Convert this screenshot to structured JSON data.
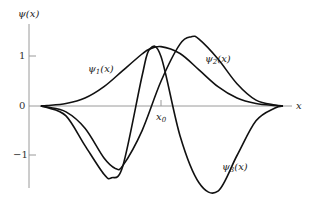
{
  "chart_data": {
    "type": "line",
    "title": "",
    "xlabel": "x",
    "ylabel": "ψ(x)",
    "x_marker": {
      "label": "x0",
      "sub": "0",
      "x": 0
    },
    "yticks": [
      1,
      0,
      -1
    ],
    "ytick_labels": [
      "1",
      "0",
      "−1"
    ],
    "ylim": [
      -1.8,
      1.8
    ],
    "xlim": [
      -3.6,
      3.6
    ],
    "grid": false,
    "legend": "inline curve labels",
    "series": [
      {
        "name": "ψ1(x)",
        "label_base": "ψ",
        "label_sub": "1",
        "x": [
          -3.0,
          -2.5,
          -2.0,
          -1.5,
          -1.0,
          -0.5,
          -0.3,
          0.0,
          0.5,
          1.0,
          1.5,
          2.0,
          2.5,
          3.0
        ],
        "values": [
          0.01,
          0.05,
          0.16,
          0.39,
          0.72,
          1.05,
          1.15,
          1.2,
          1.06,
          0.73,
          0.39,
          0.16,
          0.05,
          0.01
        ]
      },
      {
        "name": "ψ2(x)",
        "label_base": "ψ",
        "label_sub": "2",
        "x": [
          -3.0,
          -2.5,
          -2.0,
          -1.5,
          -1.2,
          -1.0,
          -0.5,
          0.0,
          0.5,
          0.8,
          1.0,
          1.5,
          2.0,
          2.5,
          3.0
        ],
        "values": [
          -0.02,
          -0.12,
          -0.45,
          -1.05,
          -1.26,
          -1.2,
          -0.5,
          0.5,
          1.25,
          1.4,
          1.35,
          0.95,
          0.45,
          0.12,
          0.02
        ]
      },
      {
        "name": "ψ3(x)",
        "label_base": "ψ",
        "label_sub": "3",
        "x": [
          -3.0,
          -2.5,
          -2.0,
          -1.5,
          -1.3,
          -1.0,
          -0.5,
          -0.3,
          0.0,
          0.5,
          1.0,
          1.5,
          2.0,
          2.5,
          3.0
        ],
        "values": [
          -0.03,
          -0.2,
          -0.8,
          -1.38,
          -1.45,
          -1.2,
          0.6,
          1.15,
          1.0,
          -0.6,
          -1.55,
          -1.72,
          -1.0,
          -0.3,
          -0.04
        ]
      }
    ]
  },
  "labels": {
    "y_axis": "ψ(x)",
    "x_axis": "x",
    "x0": "x",
    "x0_sub": "0",
    "psi1": "ψ",
    "psi1_sub": "1",
    "psi2": "ψ",
    "psi2_sub": "2",
    "psi3": "ψ",
    "psi3_sub": "3",
    "arg": "(x)",
    "tick_1": "1",
    "tick_0": "0",
    "tick_m1": "−1"
  }
}
